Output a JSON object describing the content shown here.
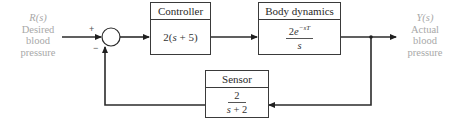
{
  "diagram": {
    "input": {
      "symbol": "R(s)",
      "lines": [
        "Desired",
        "blood",
        "pressure"
      ]
    },
    "output": {
      "symbol": "Y(s)",
      "lines": [
        "Actual",
        "blood",
        "pressure"
      ]
    },
    "summing_junction": {
      "plus_sign": "+",
      "minus_sign": "−"
    },
    "blocks": {
      "controller": {
        "title": "Controller",
        "tf_prefix": "2(",
        "tf_var": "s",
        "tf_suffix": " + 5)"
      },
      "plant": {
        "title": "Body dynamics",
        "numerator_coef": "2",
        "numerator_base": "e",
        "numerator_exp": "−sT",
        "denominator": "s"
      },
      "sensor": {
        "title": "Sensor",
        "numerator": "2",
        "denominator_var": "s",
        "denominator_rest": " + 2"
      }
    },
    "colors": {
      "line": "#2b2b2b",
      "label": "#a8a8a8"
    }
  }
}
